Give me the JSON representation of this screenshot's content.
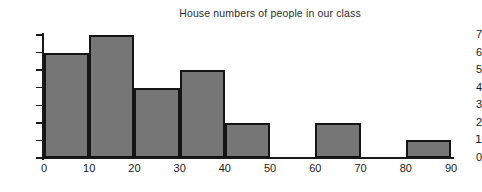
{
  "chart_data": {
    "type": "bar",
    "title": "House numbers of people in our class",
    "xlabel": "",
    "ylabel": "",
    "bin_edges": [
      0,
      10,
      20,
      30,
      40,
      50,
      60,
      70,
      80,
      90
    ],
    "categories": [
      "0-10",
      "10-20",
      "20-30",
      "30-40",
      "40-50",
      "50-60",
      "60-70",
      "70-80",
      "80-90"
    ],
    "values": [
      6,
      7,
      4,
      5,
      2,
      0,
      2,
      0,
      1
    ],
    "xlim": [
      0,
      90
    ],
    "ylim": [
      0,
      7
    ],
    "xticks": [
      0,
      10,
      20,
      30,
      40,
      50,
      60,
      70,
      80,
      90
    ],
    "xtick_labels": [
      "0",
      "10",
      "20",
      "30",
      "40",
      "50",
      "60",
      "70",
      "80",
      "90"
    ],
    "yticks": [
      0,
      1,
      2,
      3,
      4,
      5,
      6,
      7
    ],
    "ytick_labels": [
      "0",
      "1",
      "2",
      "3",
      "4",
      "5",
      "6",
      "7"
    ],
    "grid": false,
    "legend": null,
    "bar_fill_color": "#767676",
    "bar_border_color": "#151515",
    "axis_color": "#1a1a1a",
    "background_color": "#ffffff",
    "text_color": "#1a1a1a"
  }
}
